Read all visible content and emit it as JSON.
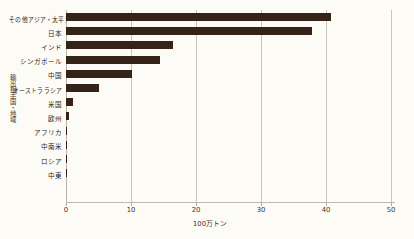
{
  "chart_data": {
    "type": "bar",
    "orientation": "horizontal",
    "title": "",
    "subtitle": "",
    "xlabel": "100万トン",
    "ylabel": "輸出相手国・地域",
    "xlim": [
      0,
      50
    ],
    "ylim": null,
    "grid": true,
    "legend": null,
    "legend_position": "none",
    "xticks": [
      0,
      10,
      20,
      30,
      40,
      50
    ],
    "xtick_labels": [
      "0",
      "10",
      "20",
      "30",
      "40",
      "50"
    ],
    "categories": [
      "その他アジア・太平洋",
      "日本",
      "インド",
      "シンガポール",
      "中国",
      "オーストララシア",
      "米国",
      "欧州",
      "アフリカ",
      "中南米",
      "ロシア",
      "中東"
    ],
    "values": [
      40.7,
      37.8,
      16.4,
      14.4,
      10.1,
      5.1,
      1.0,
      0.5,
      0.2,
      0.1,
      0.1,
      0.1
    ],
    "series": [
      {
        "name": "輸出量",
        "values": [
          40.7,
          37.8,
          16.4,
          14.4,
          10.1,
          5.1,
          1.0,
          0.5,
          0.2,
          0.1,
          0.1,
          0.1
        ]
      }
    ],
    "bar_color": "#362318",
    "grid_color": "#c9c5bd",
    "background_color": "#fdfbf6",
    "annotations": []
  }
}
